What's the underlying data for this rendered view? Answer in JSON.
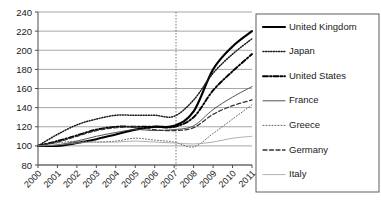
{
  "chart_data": {
    "type": "line",
    "title": "",
    "subtitle": "",
    "xlabel": "",
    "ylabel": "",
    "x": [
      2000,
      2001,
      2002,
      2003,
      2004,
      2005,
      2006,
      2007,
      2008,
      2009,
      2010,
      2011
    ],
    "xtick_labels": [
      "2000",
      "2001",
      "2002",
      "2003",
      "2004",
      "2005",
      "2006",
      "2007",
      "2008",
      "2009",
      "2010",
      "2011"
    ],
    "ytick_labels": [
      "80",
      "100",
      "120",
      "140",
      "160",
      "180",
      "200",
      "220",
      "240"
    ],
    "yticks": [
      80,
      100,
      120,
      140,
      160,
      180,
      200,
      220,
      240
    ],
    "ylim": [
      80,
      240
    ],
    "xlim": [
      2000,
      2011
    ],
    "grid": true,
    "grid_axis": "y",
    "legend_position": "right",
    "reference_line": {
      "x": 2007,
      "style": "dotted",
      "orientation": "vertical"
    },
    "series": [
      {
        "name": "United Kingdom",
        "style": "solid",
        "width": 2.1,
        "color": "#000000",
        "values": [
          100,
          100,
          103,
          107,
          112,
          117,
          120,
          121,
          136,
          180,
          204,
          220
        ]
      },
      {
        "name": "Japan",
        "style": "dotted",
        "width": 1.5,
        "color": "#1a1a1a",
        "values": [
          100,
          112,
          122,
          128,
          132,
          132,
          132,
          131,
          148,
          176,
          196,
          212
        ]
      },
      {
        "name": "United States",
        "style": "dashdot",
        "width": 1.9,
        "color": "#000000",
        "values": [
          100,
          105,
          111,
          117,
          120,
          120,
          120,
          120,
          130,
          158,
          178,
          196
        ]
      },
      {
        "name": "France",
        "style": "solid",
        "width": 0.9,
        "color": "#404040",
        "values": [
          100,
          101,
          105,
          110,
          114,
          117,
          116,
          117,
          121,
          138,
          151,
          162
        ]
      },
      {
        "name": "Greece",
        "style": "dotted",
        "width": 1.0,
        "color": "#666666",
        "values": [
          100,
          103,
          105,
          104,
          105,
          108,
          106,
          104,
          99,
          113,
          128,
          143
        ]
      },
      {
        "name": "Germany",
        "style": "dashed",
        "width": 1.3,
        "color": "#333333",
        "values": [
          100,
          104,
          110,
          116,
          119,
          120,
          117,
          116,
          119,
          133,
          142,
          148
        ]
      },
      {
        "name": "Italy",
        "style": "solid",
        "width": 0.8,
        "color": "#9a9a9a",
        "values": [
          100,
          101,
          103,
          104,
          104,
          105,
          104,
          103,
          102,
          104,
          108,
          110
        ]
      }
    ]
  },
  "legend": {
    "items": [
      {
        "label": "United Kingdom"
      },
      {
        "label": "Japan"
      },
      {
        "label": "United States"
      },
      {
        "label": "France"
      },
      {
        "label": "Greece"
      },
      {
        "label": "Germany"
      },
      {
        "label": "Italy"
      }
    ]
  }
}
